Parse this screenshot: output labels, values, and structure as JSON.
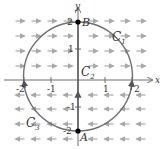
{
  "diagram": {
    "type": "vector-field-with-curves",
    "axes": {
      "x_label": "x",
      "y_label": "y",
      "x_ticks": [
        "-2",
        "-1",
        "1",
        "2"
      ],
      "y_ticks": [
        "2",
        "1",
        "-1",
        "-2"
      ],
      "x_range": [
        -2,
        2
      ],
      "y_range": [
        -2,
        2
      ]
    },
    "points": {
      "A": {
        "label": "A",
        "coord": [
          0,
          -2
        ]
      },
      "B": {
        "label": "B",
        "coord": [
          0,
          2
        ]
      }
    },
    "curves": {
      "C1": {
        "label": "C",
        "subscript": "1",
        "description": "right half of circle of radius 2 from A to B"
      },
      "C2": {
        "label": "C",
        "subscript": "2",
        "description": "segment along y-axis from A to B"
      },
      "C3": {
        "label": "C",
        "subscript": "3",
        "description": "left half of circle of radius 2"
      }
    },
    "vector_field": {
      "upper_half_direction": "right",
      "lower_half_direction": "left"
    },
    "colors": {
      "curve": "#707070",
      "axis": "#6e6e6e",
      "arrows": "#a8a8a8",
      "points": "#000000",
      "text": "#333333"
    }
  }
}
